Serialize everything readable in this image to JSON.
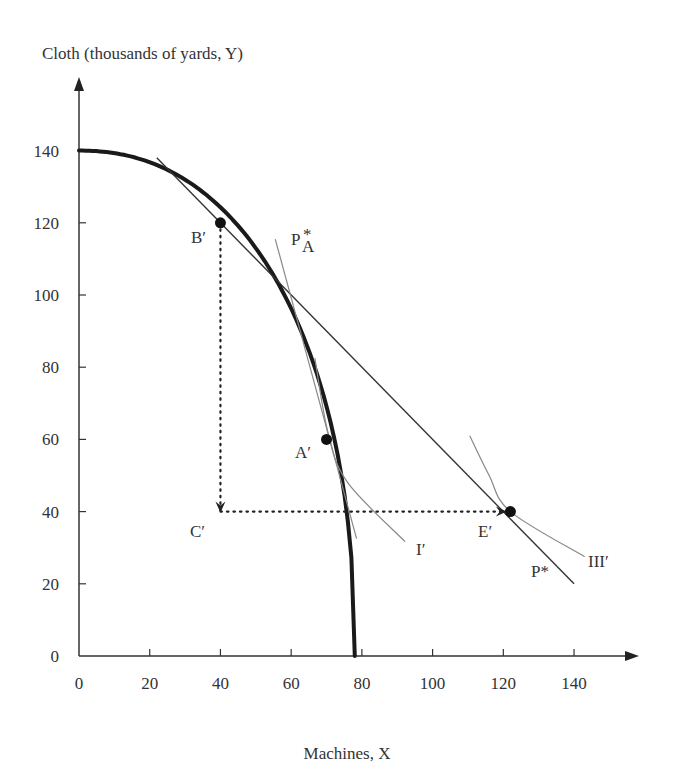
{
  "chart_data": {
    "type": "line",
    "title": "",
    "xlabel": "Machines, X",
    "ylabel": "Cloth (thousands of yards, Y)",
    "xlim": [
      0,
      155
    ],
    "ylim": [
      0,
      160
    ],
    "x_ticks": [
      0,
      20,
      40,
      60,
      80,
      100,
      120,
      140
    ],
    "y_ticks": [
      0,
      20,
      40,
      60,
      80,
      100,
      120,
      140
    ],
    "grid": false,
    "series": [
      {
        "name": "Production possibilities frontier",
        "kind": "ppf",
        "x_intercept": 78,
        "y_intercept": 140
      },
      {
        "name": "P*",
        "kind": "price-line",
        "points": [
          [
            22,
            138
          ],
          [
            140,
            20
          ]
        ]
      },
      {
        "name": "P*_A",
        "kind": "price-line",
        "points": [
          [
            55.5,
            115.5
          ],
          [
            78.5,
            32.5
          ]
        ]
      },
      {
        "name": "I'",
        "kind": "indifference-curve",
        "points": [
          [
            66.7,
            82.5
          ],
          [
            70.5,
            61.5
          ],
          [
            76,
            48
          ],
          [
            92.2,
            31.7
          ]
        ]
      },
      {
        "name": "III'",
        "kind": "indifference-curve",
        "points": [
          [
            110.5,
            61
          ],
          [
            116,
            50
          ],
          [
            122,
            40
          ],
          [
            143,
            27.5
          ]
        ]
      }
    ],
    "points": [
      {
        "label": "B'",
        "x": 40,
        "y": 120
      },
      {
        "label": "A'",
        "x": 70,
        "y": 60
      },
      {
        "label": "E'",
        "x": 122,
        "y": 40
      },
      {
        "label": "C'",
        "x": 40,
        "y": 40
      }
    ],
    "arrows": [
      {
        "name": "export-arrow",
        "from": [
          40,
          120
        ],
        "to": [
          40,
          40
        ],
        "style": "dotted"
      },
      {
        "name": "import-arrow",
        "from": [
          40,
          40
        ],
        "to": [
          121,
          40
        ],
        "style": "dotted"
      }
    ],
    "annotations": {
      "B": "B′",
      "A": "A′",
      "C": "C′",
      "E": "E′",
      "I": "I′",
      "III": "III′",
      "P_star": "P*",
      "PA_star_base": "P",
      "PA_star_sup": "*",
      "PA_star_sub": "A"
    }
  }
}
